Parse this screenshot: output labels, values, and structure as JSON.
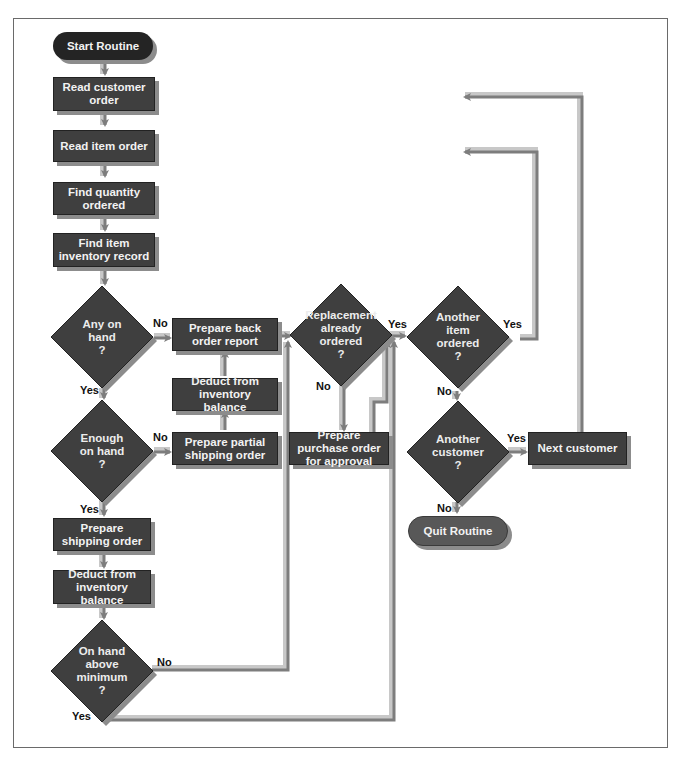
{
  "diagram": {
    "type": "flowchart",
    "colors": {
      "process_fill": "#3f3f3f",
      "start_fill": "#242424",
      "quit_fill": "#585858",
      "shadow": "#8c8c8c",
      "arrow_dark": "#7d7d7d",
      "arrow_light": "#c8c8c8",
      "label_text": "#111111",
      "node_text": "#f2f2f2"
    },
    "nodes": {
      "start": {
        "type": "terminator",
        "label": "Start Routine"
      },
      "read_customer_order": {
        "type": "process",
        "label": "Read customer order"
      },
      "read_item_order": {
        "type": "process",
        "label": "Read item order"
      },
      "find_quantity": {
        "type": "process",
        "label": "Find quantity ordered"
      },
      "find_inventory": {
        "type": "process",
        "label": "Find item inventory record"
      },
      "any_on_hand": {
        "type": "decision",
        "lines": [
          "Any on",
          "hand",
          "?"
        ]
      },
      "enough_on_hand": {
        "type": "decision",
        "lines": [
          "Enough",
          "on hand",
          "?"
        ]
      },
      "prepare_shipping": {
        "type": "process",
        "label": "Prepare shipping order"
      },
      "deduct_main": {
        "type": "process",
        "label": "Deduct from inventory balance"
      },
      "above_minimum": {
        "type": "decision",
        "lines": [
          "On hand",
          "above",
          "minimum",
          "?"
        ]
      },
      "back_order": {
        "type": "process",
        "label": "Prepare back order report"
      },
      "deduct_partial": {
        "type": "process",
        "label": "Deduct from inventory balance"
      },
      "partial_shipping": {
        "type": "process",
        "label": "Prepare partial shipping order"
      },
      "replacement_ordered": {
        "type": "decision",
        "lines": [
          "Replacement",
          "already",
          "ordered",
          "?"
        ]
      },
      "purchase_order": {
        "type": "process",
        "label": "Prepare purchase order for approval"
      },
      "another_item": {
        "type": "decision",
        "lines": [
          "Another",
          "item",
          "ordered",
          "?"
        ]
      },
      "another_customer": {
        "type": "decision",
        "lines": [
          "Another",
          "customer",
          "?"
        ]
      },
      "next_customer": {
        "type": "process",
        "label": "Next customer"
      },
      "quit": {
        "type": "terminator",
        "label": "Quit Routine"
      }
    },
    "edge_labels": {
      "any_no": "No",
      "any_yes": "Yes",
      "enough_no": "No",
      "enough_yes": "Yes",
      "minimum_no": "No",
      "minimum_yes": "Yes",
      "replacement_yes": "Yes",
      "replacement_no": "No",
      "item_yes": "Yes",
      "item_no": "No",
      "customer_yes": "Yes",
      "customer_no": "No"
    },
    "edges": [
      {
        "from": "start",
        "to": "read_customer_order"
      },
      {
        "from": "read_customer_order",
        "to": "read_item_order"
      },
      {
        "from": "read_item_order",
        "to": "find_quantity"
      },
      {
        "from": "find_quantity",
        "to": "find_inventory"
      },
      {
        "from": "find_inventory",
        "to": "any_on_hand"
      },
      {
        "from": "any_on_hand",
        "to": "back_order",
        "label": "No"
      },
      {
        "from": "any_on_hand",
        "to": "enough_on_hand",
        "label": "Yes"
      },
      {
        "from": "enough_on_hand",
        "to": "partial_shipping",
        "label": "No"
      },
      {
        "from": "enough_on_hand",
        "to": "prepare_shipping",
        "label": "Yes"
      },
      {
        "from": "partial_shipping",
        "to": "deduct_partial"
      },
      {
        "from": "deduct_partial",
        "to": "back_order"
      },
      {
        "from": "prepare_shipping",
        "to": "deduct_main"
      },
      {
        "from": "deduct_main",
        "to": "above_minimum"
      },
      {
        "from": "above_minimum",
        "to": "replacement_ordered",
        "label": "No"
      },
      {
        "from": "above_minimum",
        "to": "another_item",
        "label": "Yes"
      },
      {
        "from": "back_order",
        "to": "replacement_ordered"
      },
      {
        "from": "replacement_ordered",
        "to": "another_item",
        "label": "Yes"
      },
      {
        "from": "replacement_ordered",
        "to": "purchase_order",
        "label": "No"
      },
      {
        "from": "purchase_order",
        "to": "another_item"
      },
      {
        "from": "another_item",
        "to": "read_item_order",
        "label": "Yes"
      },
      {
        "from": "another_item",
        "to": "another_customer",
        "label": "No"
      },
      {
        "from": "another_customer",
        "to": "next_customer",
        "label": "Yes"
      },
      {
        "from": "another_customer",
        "to": "quit",
        "label": "No"
      },
      {
        "from": "next_customer",
        "to": "read_customer_order"
      }
    ]
  }
}
